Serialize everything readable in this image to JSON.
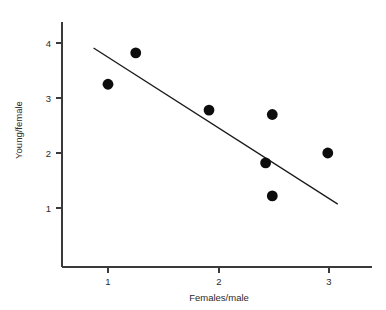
{
  "chart_data": {
    "type": "scatter",
    "title": "",
    "xlabel": "Females/male",
    "ylabel": "Young/female",
    "xlim": [
      0.55,
      3.45
    ],
    "ylim": [
      0.25,
      4.35
    ],
    "xticks": [
      1,
      2,
      3
    ],
    "xtick_labels": [
      "1",
      "2",
      "3"
    ],
    "yticks": [
      1,
      2,
      3,
      4
    ],
    "ytick_labels": [
      "1",
      "2",
      "3",
      "4"
    ],
    "grid": false,
    "legend": null,
    "marker": "filled-circle",
    "marker_color": "#0d0d0d",
    "marker_size": 5.4,
    "points": [
      {
        "x": 1.0,
        "y": 3.25
      },
      {
        "x": 1.25,
        "y": 3.82
      },
      {
        "x": 1.91,
        "y": 2.78
      },
      {
        "x": 2.42,
        "y": 1.82
      },
      {
        "x": 2.48,
        "y": 2.7
      },
      {
        "x": 2.48,
        "y": 1.22
      },
      {
        "x": 2.98,
        "y": 2.0
      }
    ],
    "series": [
      {
        "name": "Observations",
        "x": [
          1.0,
          1.25,
          1.91,
          2.42,
          2.48,
          2.48,
          2.98
        ],
        "values": [
          3.25,
          3.82,
          2.78,
          1.82,
          2.7,
          1.22,
          2.0
        ]
      }
    ],
    "trend_line": {
      "type": "linear-fit",
      "color": "#1a1a1a",
      "x_start": 0.87,
      "y_start": 3.91,
      "x_end": 3.07,
      "y_end": 1.07,
      "slope": -1.29,
      "intercept": 5.03
    },
    "axis_color": "#3a3a3a",
    "background_color": "#ffffff"
  }
}
